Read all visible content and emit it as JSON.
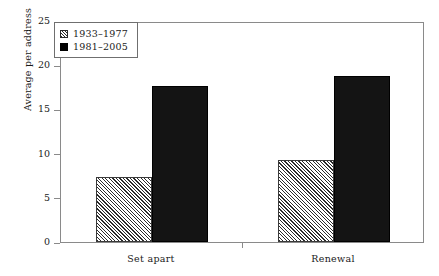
{
  "chart_data": {
    "type": "bar",
    "title": "",
    "subtitle": "",
    "xlabel": "",
    "ylabel": "Average per address",
    "categories": [
      "Set apart",
      "Renewal"
    ],
    "series": [
      {
        "name": "1933–1977",
        "values": [
          7.3,
          9.3
        ],
        "fill": "diagonal-hatch",
        "color": "#2b2b2b"
      },
      {
        "name": "1981–2005",
        "values": [
          17.6,
          18.8
        ],
        "fill": "solid",
        "color": "#141414"
      }
    ],
    "ylim": [
      0,
      25
    ],
    "ytick_labels": [
      "0",
      "5",
      "10",
      "15",
      "20",
      "25"
    ],
    "ytick_values": [
      0,
      5,
      10,
      15,
      20,
      25
    ],
    "grid": false,
    "legend_position": "top-left",
    "frame": true
  },
  "legend": {
    "entries": [
      {
        "label": "1933–1977",
        "swatch": "hatch-swatch-icon"
      },
      {
        "label": "1981–2005",
        "swatch": "solid-swatch-icon"
      }
    ]
  },
  "axes": {
    "y_title": "Average per address",
    "y_ticks": [
      "0",
      "5",
      "10",
      "15",
      "20",
      "25"
    ],
    "x_ticks": [
      "Set apart",
      "Renewal"
    ]
  },
  "colors": {
    "frame": "#8a8a8a",
    "series1": "#2b2b2b",
    "series2": "#141414",
    "background": "#ffffff",
    "text": "#1a1a1a"
  }
}
